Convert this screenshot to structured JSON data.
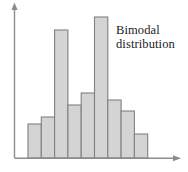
{
  "chart_data": {
    "type": "bar",
    "title": "",
    "subtitle": "",
    "xlabel": "",
    "ylabel": "",
    "categories": [
      "1",
      "2",
      "3",
      "4",
      "5",
      "6",
      "7",
      "8",
      "9"
    ],
    "values": [
      34,
      41,
      128,
      53,
      65,
      141,
      58,
      47,
      24
    ],
    "ylim": [
      0,
      153
    ],
    "xlim": [
      0,
      9
    ],
    "grid": false,
    "legend": null,
    "annotations": [
      {
        "name": "bimodal-distribution-label",
        "lines": [
          "Bimodal",
          "distribution"
        ],
        "text": "Bimodal distribution"
      }
    ],
    "axis_style": {
      "x_axis_arrow": true,
      "y_axis_arrow": true,
      "tick_labels": false
    },
    "colors": {
      "bar_fill": "#d4d4d4",
      "bar_stroke": "#808080",
      "axis": "#808080",
      "text": "#1a1a1a",
      "background": "#ffffff"
    }
  },
  "annotation": {
    "line1": "Bimodal",
    "line2": "distribution"
  }
}
